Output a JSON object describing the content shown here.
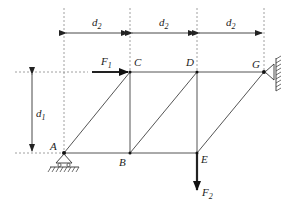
{
  "diagram": {
    "type": "truss",
    "nodes": {
      "A": {
        "label": "A",
        "x": 64,
        "y": 153
      },
      "B": {
        "label": "B",
        "x": 130,
        "y": 153
      },
      "E": {
        "label": "E",
        "x": 197,
        "y": 153
      },
      "C": {
        "label": "C",
        "x": 130,
        "y": 72
      },
      "D": {
        "label": "D",
        "x": 197,
        "y": 72
      },
      "G": {
        "label": "G",
        "x": 264,
        "y": 72
      }
    },
    "members": [
      [
        "A",
        "B"
      ],
      [
        "B",
        "E"
      ],
      [
        "C",
        "D"
      ],
      [
        "D",
        "G"
      ],
      [
        "B",
        "C"
      ],
      [
        "E",
        "D"
      ],
      [
        "A",
        "C"
      ],
      [
        "B",
        "D"
      ],
      [
        "E",
        "G"
      ]
    ],
    "supports": [
      {
        "node": "A",
        "type": "roller-pin"
      },
      {
        "node": "G",
        "type": "fixed-pin-wall"
      }
    ],
    "forces": [
      {
        "label": "F",
        "sub": "1",
        "node": "C",
        "direction": "right"
      },
      {
        "label": "F",
        "sub": "2",
        "node": "E",
        "direction": "down"
      }
    ],
    "dimensions": {
      "horizontal": [
        {
          "label": "d",
          "sub": "2"
        },
        {
          "label": "d",
          "sub": "2"
        },
        {
          "label": "d",
          "sub": "2"
        }
      ],
      "vertical": [
        {
          "label": "d",
          "sub": "1"
        }
      ]
    }
  }
}
